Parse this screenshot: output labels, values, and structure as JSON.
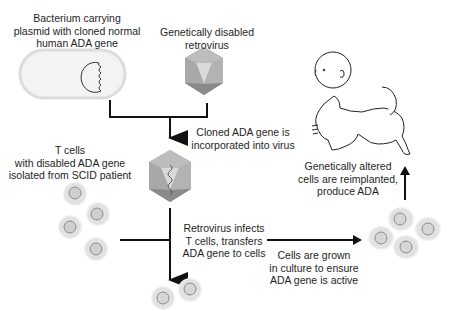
{
  "diagram": {
    "labels": {
      "bacterium": [
        "Bacterium carrying",
        "plasmid with cloned normal",
        "human ADA gene"
      ],
      "retrovirus": [
        "Genetically disabled",
        "retrovirus"
      ],
      "incorporated": [
        "Cloned ADA gene is",
        "incorporated into virus"
      ],
      "tcells": [
        "T cells",
        "with disabled ADA gene",
        "isolated from SCID patient"
      ],
      "infects": [
        "Retrovirus infects",
        "T cells, transfers",
        "ADA gene to cells"
      ],
      "culture": [
        "Cells are grown",
        "in culture to ensure",
        "ADA gene is active"
      ],
      "reimplanted": [
        "Genetically altered",
        "cells are reimplanted,",
        "produce ADA"
      ]
    },
    "nodes": [
      {
        "id": "bacterium",
        "icon": "bacterium-with-plasmid"
      },
      {
        "id": "retrovirus",
        "icon": "icosahedral-virus"
      },
      {
        "id": "recombinant-virus",
        "icon": "icosahedral-virus-with-gene"
      },
      {
        "id": "patient-tcells",
        "icon": "cell-cluster"
      },
      {
        "id": "transduced-tcells",
        "icon": "cell-pair"
      },
      {
        "id": "cultured-cells",
        "icon": "cell-cluster"
      },
      {
        "id": "baby",
        "icon": "crawling-baby"
      }
    ],
    "colors": {
      "line": "#111111",
      "cell_fill": "#e4e4e4",
      "nucleus_fill": "#cfcfcf",
      "virus_dark": "#8a8a8a",
      "virus_light": "#c8c8c8"
    }
  }
}
